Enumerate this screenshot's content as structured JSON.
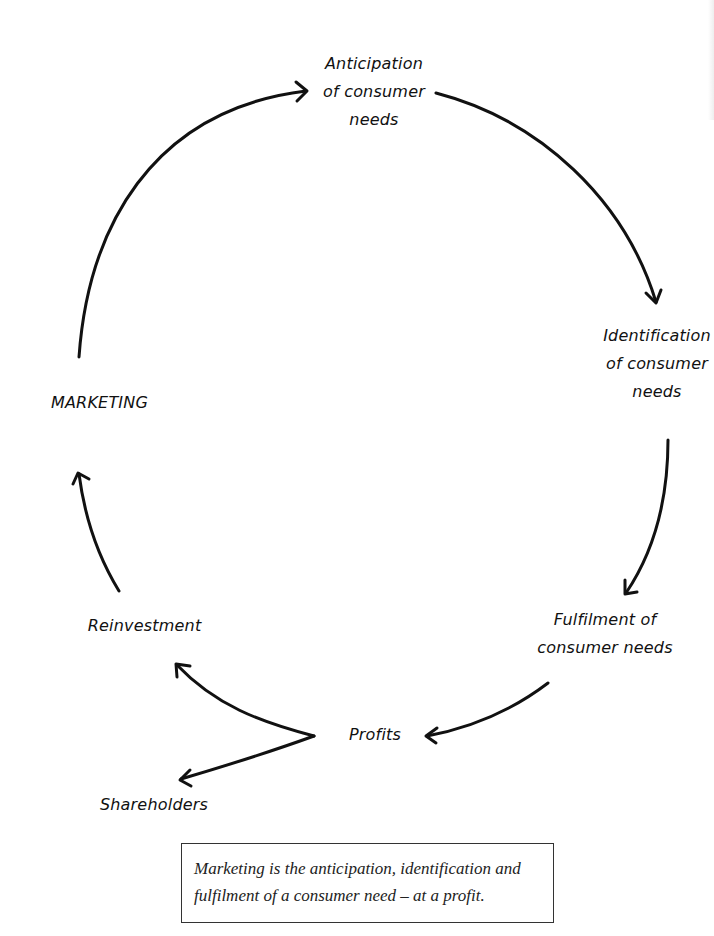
{
  "diagram": {
    "type": "cycle",
    "title_fragment": "",
    "nodes": {
      "anticipation": {
        "lines": [
          "Anticipation",
          "of consumer",
          "needs"
        ]
      },
      "identification": {
        "lines": [
          "Identification",
          "of consumer",
          "needs"
        ]
      },
      "fulfilment": {
        "lines": [
          "Fulfilment of",
          "consumer needs"
        ]
      },
      "profits": {
        "lines": [
          "Profits"
        ]
      },
      "reinvestment": {
        "lines": [
          "Reinvestment"
        ]
      },
      "shareholders": {
        "lines": [
          "Shareholders"
        ]
      },
      "marketing": {
        "lines": [
          "MARKETING"
        ]
      }
    },
    "edges": [
      {
        "from": "MARKETING",
        "to": "Anticipation of consumer needs"
      },
      {
        "from": "Anticipation of consumer needs",
        "to": "Identification of consumer needs"
      },
      {
        "from": "Identification of consumer needs",
        "to": "Fulfilment of consumer needs"
      },
      {
        "from": "Fulfilment of consumer needs",
        "to": "Profits"
      },
      {
        "from": "Profits",
        "to": "Reinvestment"
      },
      {
        "from": "Profits",
        "to": "Shareholders"
      },
      {
        "from": "Reinvestment",
        "to": "MARKETING"
      }
    ],
    "stroke_color": "#111111"
  },
  "definition_box": {
    "lines": [
      "Marketing is the anticipation, identification and",
      "fulfilment of a consumer need – at a profit."
    ]
  }
}
